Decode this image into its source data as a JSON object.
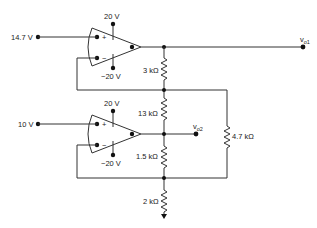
{
  "diagram": {
    "type": "op-amp circuit",
    "inputs": [
      {
        "id": "in1",
        "label": "14.7 V"
      },
      {
        "id": "in2",
        "label": "10 V"
      }
    ],
    "opamps": [
      {
        "id": "opamp1",
        "supply_pos": "20 V",
        "supply_neg": "−20 V",
        "plus": "+",
        "minus": "−"
      },
      {
        "id": "opamp2",
        "supply_pos": "20 V",
        "supply_neg": "−20 V",
        "plus": "+",
        "minus": "−"
      }
    ],
    "resistors": [
      {
        "id": "r1",
        "label": "3 kΩ"
      },
      {
        "id": "r2",
        "label": "13 kΩ"
      },
      {
        "id": "r3",
        "label": "1.5 kΩ"
      },
      {
        "id": "r4",
        "label": "2 kΩ"
      },
      {
        "id": "r5",
        "label": "4.7 kΩ"
      }
    ],
    "outputs": [
      {
        "id": "vo1",
        "label": "v",
        "sub": "o1"
      },
      {
        "id": "vo2",
        "label": "v",
        "sub": "o2"
      }
    ]
  }
}
